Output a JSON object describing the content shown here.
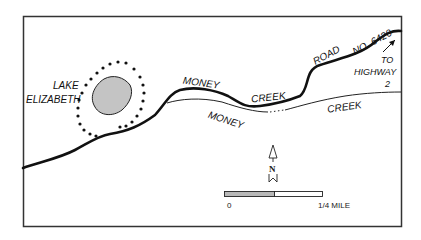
{
  "map": {
    "labels": {
      "lake_line1": "LAKE",
      "lake_line2": "ELIZABETH",
      "road_word1": "MONEY",
      "road_word2": "CREEK",
      "road_word3": "ROAD",
      "road_word4": "NO. 6420",
      "creek_word1": "MONEY",
      "creek_word2": "CREEK",
      "to_line1": "TO",
      "to_line2": "HIGHWAY",
      "to_line3": "2",
      "north": "N"
    },
    "scale_bar": {
      "start_label": "0",
      "end_label": "1/4 MILE"
    },
    "colors": {
      "lake_fill": "#c4c4c4",
      "ink": "#111111",
      "scale_fill": "#b8b8b8"
    }
  }
}
